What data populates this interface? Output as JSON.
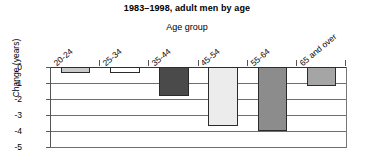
{
  "chart_data": {
    "type": "bar",
    "title": "1983–1998, adult men by age",
    "xlabel": "Age group",
    "ylabel": "Change (years)",
    "categories": [
      "20-24",
      "25-34",
      "35-44",
      "45-54",
      "55-64",
      "65 and over"
    ],
    "values": [
      -0.35,
      -0.35,
      -1.8,
      -3.7,
      -4.0,
      -1.2
    ],
    "ylim": [
      -5,
      0
    ],
    "ytick_labels": [
      "0",
      "-1",
      "-2",
      "-3",
      "-4",
      "-5"
    ],
    "ytick_values": [
      0,
      -1,
      -2,
      -3,
      -4,
      -5
    ],
    "grid": true,
    "legend": "none",
    "bar_colors": [
      "#c9c9c9",
      "#ffffff",
      "#4a4a4a",
      "#ececec",
      "#8c8c8c",
      "#a5a5a5"
    ],
    "bar_edge_color": "#2b2b2b",
    "axis_color": "#555555",
    "background": "#ffffff"
  }
}
